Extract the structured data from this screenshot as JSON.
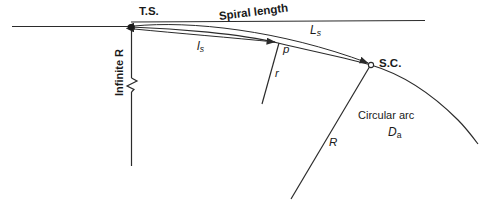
{
  "figure": {
    "type": "engineering-diagram",
    "background_color": "#ffffff",
    "line_color": "#2b2b2b",
    "text_color": "#1a1a1a"
  },
  "labels": {
    "ts_point": "T.S.",
    "sc_point": "S.C.",
    "spiral_length": "Spiral length",
    "l_s_lower": "l",
    "l_s_lower_sub": "s",
    "L_s_upper": "L",
    "L_s_upper_sub": "s",
    "point_p": "p",
    "radius_r": "r",
    "radius_R": "R",
    "circular_arc": "Circular arc",
    "D_a": "D",
    "D_a_sub": "a",
    "infinite_r": "Infinite R"
  },
  "points": {
    "ts": {
      "x": 131,
      "y": 27,
      "marker": "filled-dot"
    },
    "p": {
      "x": 278,
      "y": 43,
      "marker": "none"
    },
    "sc": {
      "x": 371,
      "y": 65,
      "marker": "open-circle"
    }
  },
  "elements": {
    "back_tangent_line": "horizontal line left of T.S.",
    "forward_tangent_line": "horizontal line right of T.S. above spiral",
    "spiral_curve": "curve from T.S. through p to S.C.",
    "circular_arc_curve": "arc continuing from S.C. to lower right",
    "infinite_radius_line": "vertical line below T.S. with break symbol",
    "radius_r_line": "line from p toward center",
    "radius_R_line": "line from S.C. toward center",
    "dim_arrow_l_s": "double arrow T.S. to p",
    "dim_arrow_L_s": "double arrow T.S. to S.C."
  }
}
